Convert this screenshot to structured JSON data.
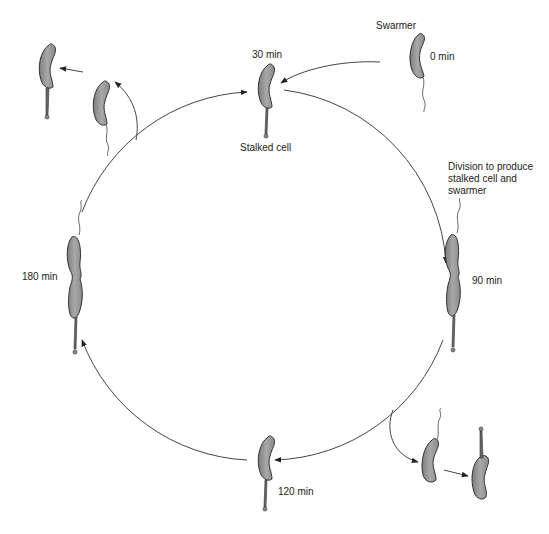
{
  "diagram": {
    "type": "cell-cycle",
    "colors": {
      "cell_fill": "#9a9a9a",
      "cell_stroke": "#333333",
      "line": "#444444",
      "background": "#ffffff"
    },
    "labels": {
      "swarmer": "Swarmer",
      "t0": "0 min",
      "t30": "30 min",
      "stalked_cell": "Stalked cell",
      "division_note": "Division to produce stalked cell and swarmer",
      "t90": "90 min",
      "t120": "120 min",
      "t180": "180 min"
    },
    "stages": [
      {
        "time": "0 min",
        "form": "swarmer cell with flagellum"
      },
      {
        "time": "30 min",
        "form": "stalked cell"
      },
      {
        "time": "90 min",
        "form": "dividing cell (stalk + flagellum)"
      },
      {
        "time": "120 min",
        "form": "stalked cell"
      },
      {
        "time": "180 min",
        "form": "dividing cell (stalk + flagellum)"
      }
    ]
  }
}
